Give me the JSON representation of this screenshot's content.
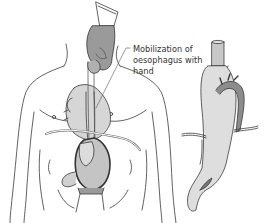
{
  "figure": {
    "callout": {
      "lines": [
        "Mobilization of",
        "oesophagus with",
        "hand"
      ]
    },
    "panels": [
      {
        "name": "torso-view",
        "description": "Front view of torso with hand mobilizing oesophagus; heart, stomach and diaphragm shown"
      },
      {
        "name": "detail-view",
        "description": "Stomach pulled up with oesophageal anastomosis and aortic arch"
      }
    ],
    "colors": {
      "outline": "#3a3a3a",
      "organ_light": "#d6d6d6",
      "organ_mid": "#bdbdbd",
      "organ_dark": "#8a8a8a",
      "glove": "#9a9a9a",
      "background": "#ffffff"
    }
  }
}
